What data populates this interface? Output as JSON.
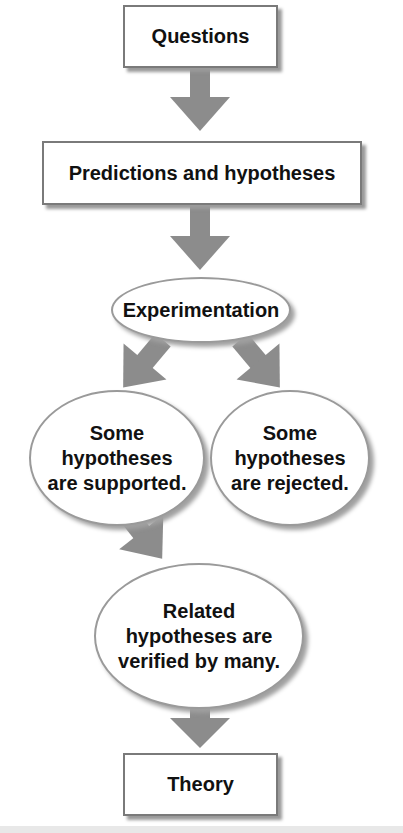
{
  "diagram": {
    "type": "flowchart",
    "colors": {
      "arrow": "#8c8c8c",
      "box_border": "#7a7a7a",
      "shadow": "#9a9a9a",
      "text": "#111111",
      "background": "#ffffff"
    },
    "nodes": {
      "questions": {
        "label": "Questions",
        "shape": "rectangle"
      },
      "predictions": {
        "label": "Predictions and hypotheses",
        "shape": "rectangle"
      },
      "experimentation": {
        "label": "Experimentation",
        "shape": "ellipse"
      },
      "supported": {
        "label": "Some\nhypotheses\nare supported.",
        "shape": "ellipse"
      },
      "rejected": {
        "label": "Some\nhypotheses\nare rejected.",
        "shape": "ellipse"
      },
      "related": {
        "label": "Related\nhypotheses are\nverified by many.",
        "shape": "ellipse"
      },
      "theory": {
        "label": "Theory",
        "shape": "rectangle"
      }
    },
    "edges": [
      {
        "from": "questions",
        "to": "predictions"
      },
      {
        "from": "predictions",
        "to": "experimentation"
      },
      {
        "from": "experimentation",
        "to": "supported"
      },
      {
        "from": "experimentation",
        "to": "rejected"
      },
      {
        "from": "supported",
        "to": "related"
      },
      {
        "from": "related",
        "to": "theory"
      }
    ]
  }
}
